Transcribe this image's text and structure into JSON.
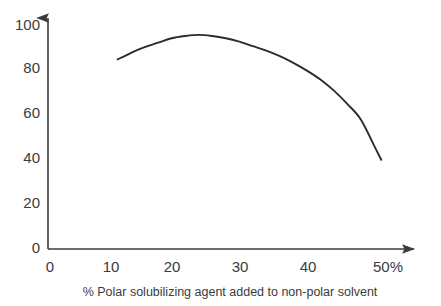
{
  "chart_data": {
    "type": "line",
    "title": "",
    "xlabel": "% Polar solubilizing agent added to non-polar solvent",
    "ylabel": "",
    "x_tick_labels": [
      "0",
      "10",
      "20",
      "30",
      "40",
      "50%"
    ],
    "x_tick_values": [
      0,
      10,
      20,
      30,
      40,
      50
    ],
    "y_tick_labels": [
      "0",
      "20",
      "40",
      "60",
      "80",
      "100"
    ],
    "y_tick_values": [
      0,
      20,
      40,
      60,
      80,
      100
    ],
    "xlim": [
      0,
      54
    ],
    "ylim": [
      0,
      106
    ],
    "grid": false,
    "legend": null,
    "axis_style": "arrow-tipped-open-axes",
    "series": [
      {
        "name": "solubility curve",
        "x": [
          10,
          12,
          14,
          16,
          18,
          20,
          22,
          24,
          26,
          28,
          30,
          32,
          34,
          36,
          38,
          40,
          42,
          44,
          46,
          48,
          49
        ],
        "values": [
          85,
          88,
          90.5,
          92.5,
          94.5,
          95.5,
          96,
          95.5,
          94.5,
          93,
          91,
          89,
          86.5,
          83.5,
          80,
          76,
          71,
          65,
          58,
          46,
          40
        ]
      }
    ]
  },
  "axis": {
    "x_label": "% Polar solubilizing agent added to non-polar solvent",
    "ticks_x": [
      {
        "label": "0"
      },
      {
        "label": "10"
      },
      {
        "label": "20"
      },
      {
        "label": "30"
      },
      {
        "label": "40"
      },
      {
        "label": "50%"
      }
    ],
    "ticks_y": [
      {
        "label": "0"
      },
      {
        "label": "20"
      },
      {
        "label": "40"
      },
      {
        "label": "60"
      },
      {
        "label": "80"
      },
      {
        "label": "100"
      }
    ]
  },
  "colors": {
    "curve": "#2b2b2b",
    "axis": "#3b3b3b",
    "text": "#3b3b3b",
    "background": "#ffffff"
  }
}
